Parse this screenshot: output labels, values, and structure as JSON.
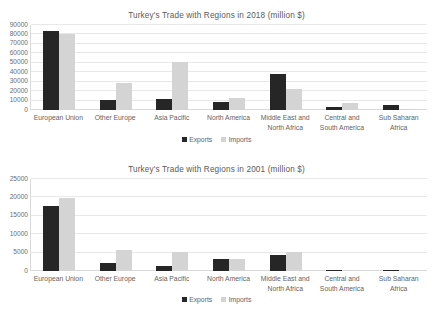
{
  "charts": [
    {
      "id": "2018",
      "title": "Turkey's Trade with Regions in 2018 (million $)",
      "legend": {
        "exports": "Exports",
        "imports": "Imports"
      }
    },
    {
      "id": "2001",
      "title": "Turkey's Trade with Regions in 2001 (million $)",
      "legend": {
        "exports": "Exports",
        "imports": "Imports"
      }
    }
  ],
  "chart_data": [
    {
      "type": "bar",
      "title": "Turkey's Trade with Regions in 2018 (million $)",
      "xlabel": "",
      "ylabel": "",
      "ylim": [
        0,
        90000
      ],
      "yticks": [
        0,
        10000,
        20000,
        30000,
        40000,
        50000,
        60000,
        70000,
        80000,
        90000
      ],
      "ytick_labels": [
        "0",
        "10000",
        "20000",
        "30000",
        "40000",
        "50000",
        "60000",
        "70000",
        "80000",
        "90000"
      ],
      "grid": true,
      "legend_position": "bottom",
      "categories": [
        "European Union",
        "Other Europe",
        "Asia Pacific",
        "North America",
        "Middle East and North Africa",
        "Central and South America",
        "Sub Saharan Africa"
      ],
      "series": [
        {
          "name": "Exports",
          "color": "#262626",
          "values": [
            84000,
            11000,
            12000,
            9000,
            38000,
            3000,
            5000
          ]
        },
        {
          "name": "Imports",
          "color": "#d4d4d4",
          "values": [
            81000,
            29000,
            51000,
            13000,
            22000,
            7000,
            1500
          ]
        }
      ]
    },
    {
      "type": "bar",
      "title": "Turkey's Trade with Regions in 2001 (million $)",
      "xlabel": "",
      "ylabel": "",
      "ylim": [
        0,
        25000
      ],
      "yticks": [
        0,
        5000,
        10000,
        15000,
        20000,
        25000
      ],
      "ytick_labels": [
        "0",
        "5000",
        "10000",
        "15000",
        "20000",
        "25000"
      ],
      "grid": true,
      "legend_position": "bottom",
      "categories": [
        "European Union",
        "Other Europe",
        "Asia Pacific",
        "North America",
        "Middle East and North Africa",
        "Central and South America",
        "Sub Saharan Africa"
      ],
      "series": [
        {
          "name": "Exports",
          "color": "#262626",
          "values": [
            17600,
            2100,
            1400,
            3200,
            4300,
            350,
            400
          ]
        },
        {
          "name": "Imports",
          "color": "#d4d4d4",
          "values": [
            19800,
            5700,
            5200,
            3300,
            5100,
            300,
            250
          ]
        }
      ]
    }
  ]
}
